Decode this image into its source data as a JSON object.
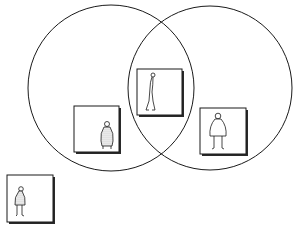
{
  "diagram": {
    "type": "venn",
    "colors": {
      "stroke": "#1a1a1a",
      "background": "#ffffff",
      "box_shadow": "#2a2a2a",
      "figure_fill": "#d8d8d8"
    },
    "sets": [
      {
        "id": "left-set",
        "cx": 111,
        "cy": 88,
        "r": 83
      },
      {
        "id": "right-set",
        "cx": 210,
        "cy": 88,
        "r": 82
      }
    ],
    "figures": [
      {
        "id": "figure-intersection",
        "region": "both sets",
        "description": "tall thin person",
        "x": 137,
        "y": 69,
        "w": 45,
        "h": 46
      },
      {
        "id": "figure-left-only",
        "region": "left set only",
        "description": "short stout shaded person",
        "x": 74,
        "y": 106,
        "w": 45,
        "h": 46
      },
      {
        "id": "figure-right-only",
        "region": "right set only",
        "description": "person with round body",
        "x": 200,
        "y": 108,
        "w": 46,
        "h": 46
      },
      {
        "id": "figure-outside",
        "region": "neither set",
        "description": "small shaded person",
        "x": 7,
        "y": 175,
        "w": 46,
        "h": 47
      }
    ]
  }
}
